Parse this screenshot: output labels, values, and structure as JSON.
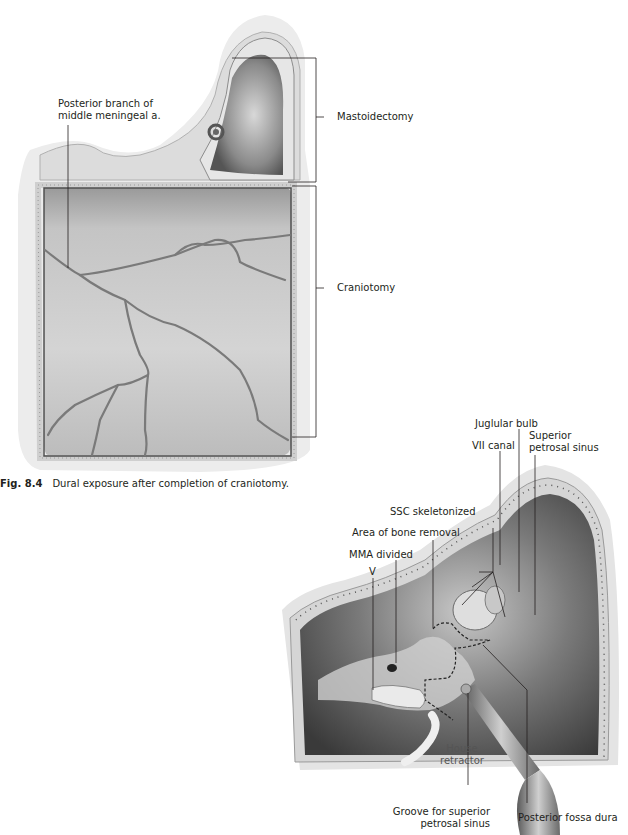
{
  "figure1": {
    "number": "Fig. 8.4",
    "caption": "Dural exposure after completion of craniotomy.",
    "labels": {
      "posterior_branch_line1": "Posterior branch of",
      "posterior_branch_line2": "middle meningeal a.",
      "mastoidectomy": "Mastoidectomy",
      "craniotomy": "Craniotomy"
    }
  },
  "figure2": {
    "labels": {
      "juglular_bulb": "Juglular bulb",
      "vii_canal": "VII canal",
      "superior_petrosal_sinus_line1": "Superior",
      "superior_petrosal_sinus_line2": "petrosal sinus",
      "ssc_skeletonized": "SSC skeletonized",
      "area_of_bone_removal": "Area of bone removal",
      "mma_divided": "MMA divided",
      "v": "V",
      "house_retractor_line1": "House",
      "house_retractor_line2": "retractor",
      "groove_line1": "Groove for superior",
      "groove_line2": "petrosal sinus",
      "posterior_fossa_dura": "Posterior fossa dura"
    }
  }
}
